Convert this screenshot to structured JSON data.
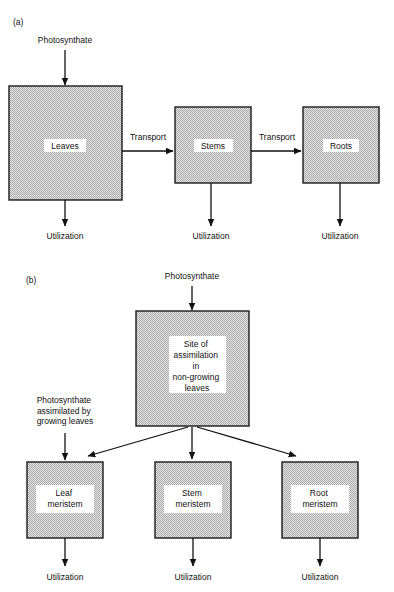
{
  "figure": {
    "background_color": "#ffffff",
    "ink_color": "#111111",
    "box_fill_color": "#c8c8c8",
    "box_fill_style": "stipple-checker",
    "box_border_color": "#1a1a1a",
    "panels": [
      {
        "id": "panel-a",
        "label": "(a)",
        "label_x": 13,
        "label_y": 25,
        "inputs": [
          {
            "id": "input-photosynthate-a",
            "text": "Photosynthate",
            "text_x": 65,
            "text_y": 43,
            "arrow": {
              "x1": 65,
              "y1": 50,
              "x2": 65,
              "y2": 85
            }
          }
        ],
        "boxes": [
          {
            "id": "box-leaves",
            "label": "Leaves",
            "x": 9,
            "y": 86,
            "w": 113,
            "h": 114,
            "label_x": 65,
            "label_y": 146,
            "plate": null
          },
          {
            "id": "box-stems",
            "label": "Stems",
            "x": 175,
            "y": 107,
            "w": 76,
            "h": 76,
            "label_x": 213,
            "label_y": 146,
            "plate": null
          },
          {
            "id": "box-roots",
            "label": "Roots",
            "x": 303,
            "y": 107,
            "w": 76,
            "h": 76,
            "label_x": 341,
            "label_y": 146,
            "plate": null
          }
        ],
        "transfers": [
          {
            "id": "transfer-leaves-stems",
            "label": "Transport",
            "label_x": 148,
            "label_y": 137,
            "arrow": {
              "x1": 122,
              "y1": 151,
              "x2": 174,
              "y2": 151
            }
          },
          {
            "id": "transfer-stems-roots",
            "label": "Transport",
            "label_x": 277,
            "label_y": 137,
            "arrow": {
              "x1": 251,
              "y1": 151,
              "x2": 302,
              "y2": 151
            }
          }
        ],
        "outputs": [
          {
            "id": "output-utilization-leaves",
            "text": "Utilization",
            "text_x": 65,
            "text_y": 236,
            "arrow": {
              "x1": 65,
              "y1": 200,
              "x2": 65,
              "y2": 226
            }
          },
          {
            "id": "output-utilization-stems",
            "text": "Utilization",
            "text_x": 211,
            "text_y": 236,
            "arrow": {
              "x1": 211,
              "y1": 183,
              "x2": 211,
              "y2": 226
            }
          },
          {
            "id": "output-utilization-roots",
            "text": "Utilization",
            "text_x": 340,
            "text_y": 236,
            "arrow": {
              "x1": 340,
              "y1": 183,
              "x2": 340,
              "y2": 226
            }
          }
        ]
      },
      {
        "id": "panel-b",
        "label": "(b)",
        "label_x": 26,
        "label_y": 283,
        "inputs": [
          {
            "id": "input-photosynthate-b",
            "text": "Photosynthate",
            "text_x": 192,
            "text_y": 279,
            "arrow": {
              "x1": 192,
              "y1": 286,
              "x2": 192,
              "y2": 310
            }
          },
          {
            "id": "input-photosynthate-growing-leaves",
            "text_lines": [
              "Photosynthate",
              "assimilated by",
              "growing leaves"
            ],
            "text_x": 65,
            "text_y": 403,
            "line_height": 10.5,
            "arrow": {
              "x1": 65,
              "y1": 433,
              "x2": 65,
              "y2": 460
            }
          }
        ],
        "boxes": [
          {
            "id": "box-site-of-assimilation",
            "x": 136,
            "y": 311,
            "w": 113,
            "h": 115,
            "plate": {
              "x": 170,
              "y": 336,
              "w": 55,
              "h": 57
            },
            "label_lines": [
              "Site of",
              "assimilation",
              "in",
              "non-growing",
              "leaves"
            ],
            "label_x": 197,
            "label_y": 347,
            "line_height": 11
          },
          {
            "id": "box-leaf-meristem",
            "x": 27,
            "y": 462,
            "w": 76,
            "h": 76,
            "plate": {
              "x": 37,
              "y": 486,
              "w": 57,
              "h": 27
            },
            "label_lines": [
              "Leaf",
              "meristem"
            ],
            "label_x": 65,
            "label_y": 496,
            "line_height": 11
          },
          {
            "id": "box-stem-meristem",
            "x": 155,
            "y": 462,
            "w": 76,
            "h": 76,
            "plate": {
              "x": 164,
              "y": 486,
              "w": 57,
              "h": 27
            },
            "label_lines": [
              "Stem",
              "meristem"
            ],
            "label_x": 193,
            "label_y": 496,
            "line_height": 11
          },
          {
            "id": "box-root-meristem",
            "x": 282,
            "y": 462,
            "w": 76,
            "h": 76,
            "plate": {
              "x": 291,
              "y": 486,
              "w": 57,
              "h": 27
            },
            "label_lines": [
              "Root",
              "meristem"
            ],
            "label_x": 320,
            "label_y": 496,
            "line_height": 11
          }
        ],
        "transfers": [
          {
            "id": "transfer-assimilation-leaf",
            "label": "",
            "arrow": {
              "x1": 188,
              "y1": 427,
              "x2": 87,
              "y2": 456
            }
          },
          {
            "id": "transfer-assimilation-stem",
            "label": "",
            "arrow": {
              "x1": 192,
              "y1": 427,
              "x2": 192,
              "y2": 459
            }
          },
          {
            "id": "transfer-assimilation-root",
            "label": "",
            "arrow": {
              "x1": 197,
              "y1": 427,
              "x2": 297,
              "y2": 456
            }
          }
        ],
        "outputs": [
          {
            "id": "output-utilization-leaf-meristem",
            "text": "Utilization",
            "text_x": 65,
            "text_y": 578,
            "arrow": {
              "x1": 65,
              "y1": 538,
              "x2": 65,
              "y2": 566
            }
          },
          {
            "id": "output-utilization-stem-meristem",
            "text": "Utilization",
            "text_x": 193,
            "text_y": 578,
            "arrow": {
              "x1": 193,
              "y1": 538,
              "x2": 193,
              "y2": 566
            }
          },
          {
            "id": "output-utilization-root-meristem",
            "text": "Utilization",
            "text_x": 320,
            "text_y": 578,
            "arrow": {
              "x1": 320,
              "y1": 538,
              "x2": 320,
              "y2": 566
            }
          }
        ]
      }
    ]
  }
}
